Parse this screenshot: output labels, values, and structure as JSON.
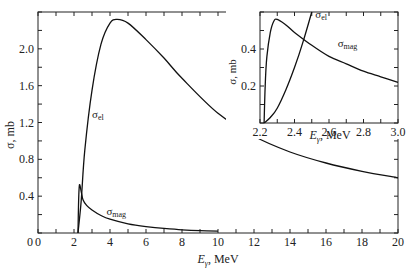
{
  "chart_data": [
    {
      "type": "line",
      "title": "",
      "xlabel": "E_γ, MeV",
      "ylabel": "σ, mb",
      "xlim": [
        0,
        20
      ],
      "ylim": [
        0,
        2.4
      ],
      "xticks": [
        0,
        2,
        4,
        6,
        8,
        10,
        12,
        14,
        16,
        18,
        20
      ],
      "xtick_labels": [
        "0",
        "2",
        "4",
        "6",
        "8",
        "10",
        "12",
        "14",
        "16",
        "18",
        "20"
      ],
      "yticks": [
        0.4,
        0.8,
        1.2,
        1.6,
        2.0
      ],
      "ytick_labels": [
        "0.4",
        "0.8",
        "1.2",
        "1.6",
        "2.0"
      ],
      "grid": false,
      "legend": "inline labels",
      "series": [
        {
          "name": "σ_el",
          "label": "σ",
          "label_sub": "el",
          "x": [
            2.22,
            2.4,
            2.6,
            3.0,
            3.5,
            4.0,
            4.4,
            5.0,
            6.0,
            7.0,
            8.0,
            10.0,
            12.0,
            14.0,
            16.0,
            18.0,
            20.0
          ],
          "y": [
            0.0,
            0.35,
            0.9,
            1.55,
            2.05,
            2.28,
            2.32,
            2.28,
            2.1,
            1.9,
            1.68,
            1.3,
            1.05,
            0.88,
            0.76,
            0.67,
            0.6
          ]
        },
        {
          "name": "σ_mag",
          "label": "σ",
          "label_sub": "mag",
          "x": [
            2.22,
            2.25,
            2.3,
            2.4,
            2.5,
            2.7,
            3.0,
            3.5,
            4.0,
            5.0,
            6.0,
            7.0,
            8.0,
            9.0,
            10.0
          ],
          "y": [
            0.0,
            0.3,
            0.52,
            0.45,
            0.36,
            0.3,
            0.25,
            0.19,
            0.15,
            0.1,
            0.07,
            0.05,
            0.035,
            0.025,
            0.02
          ]
        }
      ],
      "annotations": [
        {
          "text": "σel",
          "x": 3.2,
          "y": 1.2
        },
        {
          "text": "σmag",
          "x": 3.8,
          "y": 0.3
        }
      ]
    },
    {
      "type": "line",
      "title": "inset",
      "xlabel": "E_γ, MeV",
      "ylabel": "σ, mb",
      "xlim": [
        2.2,
        3.0
      ],
      "ylim": [
        0,
        0.6
      ],
      "xticks": [
        2.2,
        2.4,
        2.6,
        2.8,
        3.0
      ],
      "xtick_labels": [
        "2.2",
        "2.4",
        "2.6",
        "2.8",
        "3.0"
      ],
      "yticks": [
        0.2,
        0.4
      ],
      "ytick_labels": [
        "0.2",
        "0.4"
      ],
      "grid": false,
      "series": [
        {
          "name": "σ_el",
          "label": "σ",
          "label_sub": "el",
          "x": [
            2.224,
            2.26,
            2.3,
            2.35,
            2.4,
            2.45,
            2.5
          ],
          "y": [
            0.0,
            0.03,
            0.08,
            0.18,
            0.3,
            0.44,
            0.6
          ]
        },
        {
          "name": "σ_mag",
          "label": "σ",
          "label_sub": "mag",
          "x": [
            2.224,
            2.23,
            2.24,
            2.26,
            2.28,
            2.3,
            2.35,
            2.4,
            2.5,
            2.6,
            2.7,
            2.8,
            2.9,
            3.0
          ],
          "y": [
            0.0,
            0.2,
            0.36,
            0.49,
            0.55,
            0.56,
            0.53,
            0.49,
            0.42,
            0.36,
            0.32,
            0.28,
            0.25,
            0.22
          ]
        }
      ]
    }
  ]
}
